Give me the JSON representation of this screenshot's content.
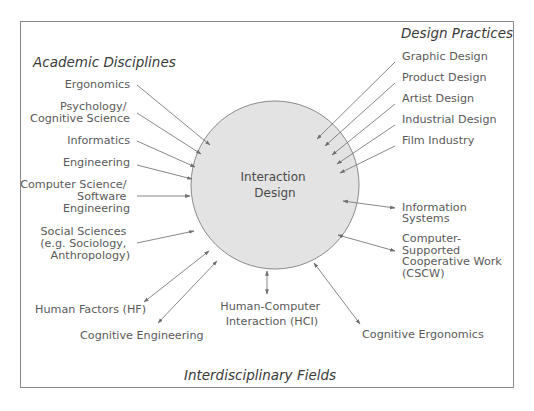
{
  "diagram": {
    "center_label": [
      "Interaction",
      "Design"
    ],
    "colors": {
      "circle_fill": "#e3e3e3",
      "circle_stroke": "#8a8a8a",
      "arrow": "#7a7a7a",
      "text": "#5a5a5a",
      "category_text": "#3a3a3a",
      "border": "#8a8a8a"
    },
    "categories": {
      "academic": "Academic Disciplines",
      "design": "Design Practices",
      "interdisciplinary": "Interdisciplinary Fields"
    },
    "academic_disciplines": [
      {
        "label": [
          "Ergonomics"
        ],
        "arrow": "one-way"
      },
      {
        "label": [
          "Psychology/",
          "Cognitive Science"
        ],
        "arrow": "one-way"
      },
      {
        "label": [
          "Informatics"
        ],
        "arrow": "one-way"
      },
      {
        "label": [
          "Engineering"
        ],
        "arrow": "one-way"
      },
      {
        "label": [
          "Computer Science/",
          "Software",
          "Engineering"
        ],
        "arrow": "one-way"
      },
      {
        "label": [
          "Social Sciences",
          "(e.g. Sociology,",
          "Anthropology)"
        ],
        "arrow": "one-way"
      }
    ],
    "design_practices": [
      {
        "label": [
          "Graphic Design"
        ],
        "arrow": "one-way"
      },
      {
        "label": [
          "Product Design"
        ],
        "arrow": "one-way"
      },
      {
        "label": [
          "Artist Design"
        ],
        "arrow": "one-way"
      },
      {
        "label": [
          "Industrial Design"
        ],
        "arrow": "one-way"
      },
      {
        "label": [
          "Film Industry"
        ],
        "arrow": "one-way"
      }
    ],
    "interdisciplinary_fields": [
      {
        "label": [
          "Information",
          "Systems"
        ],
        "arrow": "two-way"
      },
      {
        "label": [
          "Computer-",
          "Supported",
          "Cooperative Work",
          "(CSCW)"
        ],
        "arrow": "two-way"
      },
      {
        "label": [
          "Human Factors (HF)"
        ],
        "arrow": "two-way"
      },
      {
        "label": [
          "Cognitive Engineering"
        ],
        "arrow": "two-way"
      },
      {
        "label": [
          "Human-Computer",
          "Interaction (HCI)"
        ],
        "arrow": "two-way"
      },
      {
        "label": [
          "Cognitive Ergonomics"
        ],
        "arrow": "two-way"
      }
    ]
  }
}
